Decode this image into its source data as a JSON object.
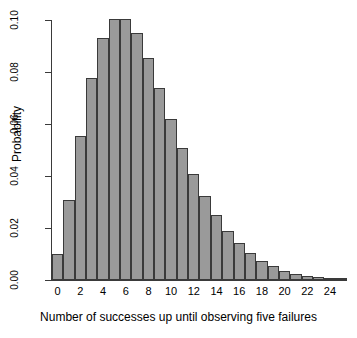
{
  "chart_data": {
    "type": "bar",
    "title": "",
    "subtitle": "",
    "xlabel": "Number of successes up until observing five failures",
    "ylabel": "Probability",
    "xlim": [
      -0.5,
      25.5
    ],
    "ylim": [
      0.0,
      0.1
    ],
    "grid": false,
    "legend": null,
    "x_tick_labels": [
      "0",
      "2",
      "4",
      "6",
      "8",
      "10",
      "12",
      "14",
      "16",
      "18",
      "20",
      "22",
      "24"
    ],
    "x_tick_values": [
      0,
      2,
      4,
      6,
      8,
      10,
      12,
      14,
      16,
      18,
      20,
      22,
      24
    ],
    "y_tick_labels": [
      "0.00",
      "0.02",
      "0.04",
      "0.06",
      "0.08",
      "0.10"
    ],
    "y_tick_values": [
      0.0,
      0.02,
      0.04,
      0.06,
      0.08,
      0.1
    ],
    "categories": [
      0,
      1,
      2,
      3,
      4,
      5,
      6,
      7,
      8,
      9,
      10,
      11,
      12,
      13,
      14,
      15,
      16,
      17,
      18,
      19,
      20,
      21,
      22,
      23,
      24,
      25
    ],
    "values": [
      0.0099,
      0.0309,
      0.0555,
      0.0776,
      0.0931,
      0.1002,
      0.1002,
      0.0949,
      0.0854,
      0.074,
      0.0621,
      0.0509,
      0.0409,
      0.0322,
      0.0249,
      0.0189,
      0.0141,
      0.0103,
      0.0074,
      0.0052,
      0.0036,
      0.0025,
      0.0017,
      0.0011,
      0.0008,
      0.0005
    ],
    "bar_fill_color": "#9a9a9a",
    "bar_border_color": "#3a3a3a",
    "background_color": "#ffffff",
    "axis_color": "#3a3a3a"
  }
}
